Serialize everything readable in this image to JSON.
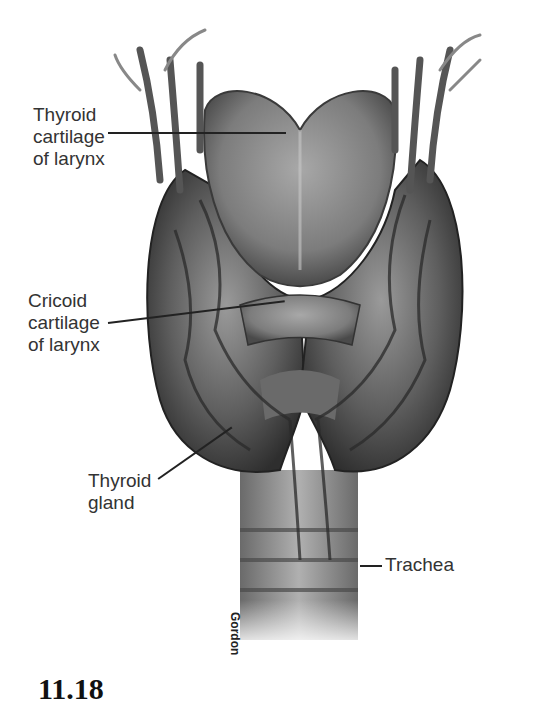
{
  "figure": {
    "labels": [
      {
        "id": "thyroid-cartilage",
        "lines": [
          "Thyroid",
          "cartilage",
          "of larynx"
        ]
      },
      {
        "id": "cricoid-cartilage",
        "lines": [
          "Cricoid",
          "cartilage",
          "of larynx"
        ]
      },
      {
        "id": "thyroid-gland",
        "lines": [
          "Thyroid",
          "gland"
        ]
      },
      {
        "id": "trachea",
        "lines": [
          "Trachea"
        ]
      }
    ],
    "credit": "Gordon",
    "figure_number": "11.18"
  },
  "colors": {
    "background": "#ffffff",
    "text": "#333333",
    "leader_line": "#222222",
    "tissue_dark": "#3a3a3a",
    "tissue_mid": "#7a7a7a",
    "tissue_light": "#b8b8b8"
  }
}
